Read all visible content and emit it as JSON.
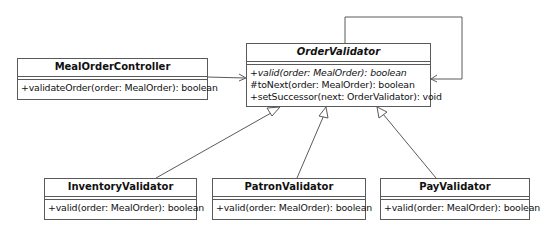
{
  "diagram": {
    "type": "UML class diagram",
    "classes": [
      {
        "id": "meal-order-controller",
        "name": "MealOrderController",
        "abstract": false,
        "operations": [
          {
            "text": "+validateOrder(order: MealOrder): boolean",
            "abstract": false
          }
        ]
      },
      {
        "id": "order-validator",
        "name": "OrderValidator",
        "abstract": true,
        "operations": [
          {
            "text": "+valid(order: MealOrder): boolean",
            "abstract": true
          },
          {
            "text": "#toNext(order: MealOrder): boolean",
            "abstract": false
          },
          {
            "text": "+setSuccessor(next: OrderValidator): void",
            "abstract": false
          }
        ]
      },
      {
        "id": "inventory-validator",
        "name": "InventoryValidator",
        "abstract": false,
        "operations": [
          {
            "text": "+valid(order: MealOrder): boolean",
            "abstract": false
          }
        ]
      },
      {
        "id": "patron-validator",
        "name": "PatronValidator",
        "abstract": false,
        "operations": [
          {
            "text": "+valid(order: MealOrder): boolean",
            "abstract": false
          }
        ]
      },
      {
        "id": "pay-validator",
        "name": "PayValidator",
        "abstract": false,
        "operations": [
          {
            "text": "+valid(order: MealOrder): boolean",
            "abstract": false
          }
        ]
      }
    ],
    "relationships": [
      {
        "type": "association",
        "from": "MealOrderController",
        "to": "OrderValidator"
      },
      {
        "type": "self-association",
        "from": "OrderValidator",
        "to": "OrderValidator"
      },
      {
        "type": "generalization",
        "from": "InventoryValidator",
        "to": "OrderValidator"
      },
      {
        "type": "generalization",
        "from": "PatronValidator",
        "to": "OrderValidator"
      },
      {
        "type": "generalization",
        "from": "PayValidator",
        "to": "OrderValidator"
      }
    ],
    "colors": {
      "line": "#5a5a5a",
      "background": "#ffffff",
      "text": "#111111"
    }
  }
}
